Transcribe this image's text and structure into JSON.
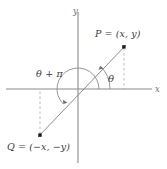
{
  "figure": {
    "type": "coordinate-diagram",
    "title": "",
    "background_color": "#ffffff",
    "axis_color": "#8a8a8a",
    "line_color": "#8c8c8c",
    "dash_color": "#b4b4b4",
    "point_color": "#1a1a1a",
    "text_color": "#3a3a3a",
    "axes": {
      "x_label": "x",
      "y_label": "y",
      "origin_px": [
        78,
        89
      ],
      "x_axis_y_px": 89,
      "y_axis_x_px": 78
    },
    "points": [
      {
        "name": "P",
        "label": "P = (x, y)",
        "coords": "(x, y)",
        "px": [
          124,
          47
        ],
        "quadrant": 1
      },
      {
        "name": "Q",
        "label": "Q = (−x, −y)",
        "coords": "(−x, −y)",
        "px": [
          40,
          135
        ],
        "quadrant": 3
      }
    ],
    "angles": [
      {
        "name": "theta",
        "label": "θ",
        "from_deg": 0,
        "to_deg": 46,
        "radius_px": 32,
        "arrow": true
      },
      {
        "name": "theta-plus-pi",
        "label": "θ + π",
        "from_deg": 0,
        "to_deg": 226,
        "radius_px": 21,
        "arrow": true
      }
    ],
    "segments": [
      {
        "name": "line-through-origin",
        "from": "Q",
        "to": "P",
        "style": "solid"
      },
      {
        "name": "p-drop-line",
        "from": "P",
        "to": "x-axis",
        "style": "dashed"
      },
      {
        "name": "q-drop-line",
        "from": "Q",
        "to": "x-axis",
        "style": "dashed"
      }
    ]
  }
}
